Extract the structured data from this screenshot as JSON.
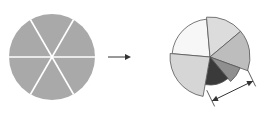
{
  "diagram": {
    "colors": {
      "background": "#ffffff",
      "uniform_fill": "#a9a9a9",
      "divider": "#ffffff",
      "outline": "#555555",
      "arrow": "#333333"
    },
    "source_pie": {
      "slices": 6,
      "center": [
        52,
        57
      ],
      "radius": 43
    },
    "transform_arrow": {
      "from": [
        108,
        57
      ],
      "to": [
        131,
        57
      ]
    },
    "result_pie": {
      "center": [
        210,
        57
      ],
      "slices": [
        {
          "name": "slice-upper-left",
          "start": 185,
          "end": 265,
          "radius": 38,
          "fill": "#f7f7f7"
        },
        {
          "name": "slice-top",
          "start": 265,
          "end": 320,
          "radius": 40,
          "fill": "#dcdcdc"
        },
        {
          "name": "slice-right",
          "start": 320,
          "end": 20,
          "radius": 40,
          "fill": "#bdbdbd"
        },
        {
          "name": "slice-lower-right",
          "start": 20,
          "end": 50,
          "radius": 32,
          "fill": "#8f8f8f"
        },
        {
          "name": "slice-bottom-dark",
          "start": 50,
          "end": 100,
          "radius": 28,
          "fill": "#3a3a3a"
        },
        {
          "name": "slice-lower-left",
          "start": 100,
          "end": 185,
          "radius": 40,
          "fill": "#d6d6d6"
        }
      ]
    },
    "dimension_arrow": {
      "from": [
        212,
        101
      ],
      "to": [
        253,
        81
      ],
      "label": ""
    }
  }
}
